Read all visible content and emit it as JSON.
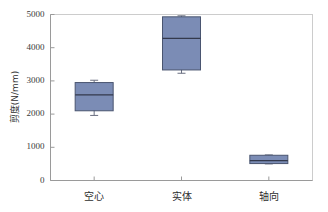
{
  "chart_data": {
    "type": "box",
    "title": "",
    "xlabel": "",
    "ylabel": "剪度(N/mm)",
    "categories": [
      "空心",
      "实体",
      "轴向"
    ],
    "ylim": [
      0,
      5000
    ],
    "yticks": [
      0,
      1000,
      2000,
      3000,
      4000,
      5000
    ],
    "ytick_labels": [
      "0",
      "1000",
      "2000",
      "3000",
      "4000",
      "5000"
    ],
    "grid": false,
    "legend": "none",
    "boxes": [
      {
        "category": "空心",
        "whisker_low": 1960,
        "q1": 2100,
        "median": 2580,
        "q3": 2950,
        "whisker_high": 3020
      },
      {
        "category": "实体",
        "whisker_low": 3230,
        "q1": 3330,
        "median": 4280,
        "q3": 4930,
        "whisker_high": 4960
      },
      {
        "category": "轴向",
        "whisker_low": 500,
        "q1": 510,
        "median": 600,
        "q3": 760,
        "whisker_high": 770
      }
    ],
    "colors": {
      "box_fill": "#7b8cb5",
      "box_edge": "#4a5570",
      "median_line": "#33394d",
      "whisker": "#6a6f80",
      "axis": "#b9b9b9",
      "frame": "#cccccc",
      "text": "#2e2e2e"
    }
  }
}
